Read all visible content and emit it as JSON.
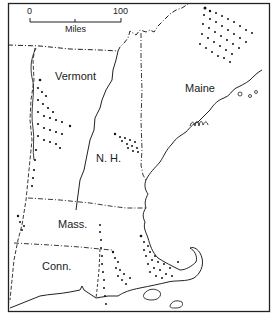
{
  "map": {
    "region": "New England",
    "scale": {
      "min": "0",
      "max": "100",
      "unit": "Miles"
    },
    "states": [
      {
        "name": "Vermont",
        "x": 55,
        "y": 70
      },
      {
        "name": "Maine",
        "x": 185,
        "y": 82
      },
      {
        "name": "N. H.",
        "x": 96,
        "y": 152
      },
      {
        "name": "Mass.",
        "x": 58,
        "y": 218
      },
      {
        "name": "Conn.",
        "x": 42,
        "y": 260
      }
    ],
    "colors": {
      "line": "#222222",
      "background": "#ffffff",
      "dots": "#111111"
    }
  }
}
